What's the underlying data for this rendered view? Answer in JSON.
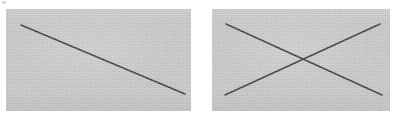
{
  "figure": {
    "caption": "",
    "background_color": "#ffffff",
    "width": 397,
    "height": 121,
    "panel_fill_color": "#c7c7c7",
    "line_color": "#3b3b3b",
    "line_width": 1.6,
    "panels": [
      {
        "id": "left-panel",
        "name": "single-diagonal-panel",
        "label": "",
        "x": 6,
        "y": 9,
        "width": 185,
        "height": 102,
        "lines": [
          {
            "id": "descending-diagonal",
            "name": "line-top-left-to-bottom-right",
            "x1": 15,
            "y1": 16,
            "x2": 179,
            "y2": 85
          }
        ]
      },
      {
        "id": "right-panel",
        "name": "crossed-diagonals-panel",
        "label": "",
        "x": 212,
        "y": 9,
        "width": 178,
        "height": 102,
        "lines": [
          {
            "id": "descending-diagonal",
            "name": "line-top-left-to-bottom-right",
            "x1": 14,
            "y1": 15,
            "x2": 170,
            "y2": 86
          },
          {
            "id": "ascending-diagonal",
            "name": "line-bottom-left-to-top-right",
            "x1": 13,
            "y1": 86,
            "x2": 168,
            "y2": 15
          }
        ]
      }
    ],
    "artifacts": [
      {
        "id": "speck-top-left",
        "name": "scan-speck",
        "x": 2,
        "y": 1,
        "width": 4,
        "height": 3
      }
    ]
  }
}
